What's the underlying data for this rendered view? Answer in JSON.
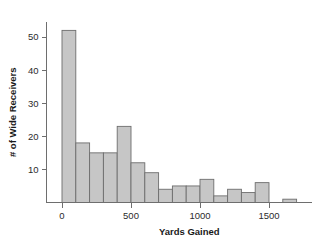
{
  "chart_data": {
    "type": "bar",
    "title": "",
    "xlabel": "Yards Gained",
    "ylabel": "# of Wide Receivers",
    "xlim": [
      -60,
      1760
    ],
    "ylim": [
      0,
      56
    ],
    "grid": false,
    "legend": null,
    "bin_width": 100,
    "bar_fill": "#c6c6c6",
    "bar_stroke": "#6d6d6d",
    "axis_color": "#6e6e6e",
    "xticks": [
      0,
      500,
      1000,
      1500
    ],
    "xtick_labels": [
      "0",
      "500",
      "1000",
      "1500"
    ],
    "yticks": [
      10,
      20,
      30,
      40,
      50
    ],
    "ytick_labels": [
      "10",
      "20",
      "30",
      "40",
      "50"
    ],
    "bins": [
      {
        "x0": 0,
        "x1": 100,
        "count": 52
      },
      {
        "x0": 100,
        "x1": 200,
        "count": 18
      },
      {
        "x0": 200,
        "x1": 300,
        "count": 15
      },
      {
        "x0": 300,
        "x1": 400,
        "count": 15
      },
      {
        "x0": 400,
        "x1": 500,
        "count": 23
      },
      {
        "x0": 500,
        "x1": 600,
        "count": 12
      },
      {
        "x0": 600,
        "x1": 700,
        "count": 9
      },
      {
        "x0": 700,
        "x1": 800,
        "count": 4
      },
      {
        "x0": 800,
        "x1": 900,
        "count": 5
      },
      {
        "x0": 900,
        "x1": 1000,
        "count": 5
      },
      {
        "x0": 1000,
        "x1": 1100,
        "count": 7
      },
      {
        "x0": 1100,
        "x1": 1200,
        "count": 2
      },
      {
        "x0": 1200,
        "x1": 1300,
        "count": 4
      },
      {
        "x0": 1300,
        "x1": 1400,
        "count": 3
      },
      {
        "x0": 1400,
        "x1": 1500,
        "count": 6
      },
      {
        "x0": 1600,
        "x1": 1700,
        "count": 1
      }
    ],
    "categories": [
      "0-100",
      "100-200",
      "200-300",
      "300-400",
      "400-500",
      "500-600",
      "600-700",
      "700-800",
      "800-900",
      "900-1000",
      "1000-1100",
      "1100-1200",
      "1200-1300",
      "1300-1400",
      "1400-1500",
      "1600-1700"
    ],
    "values": [
      52,
      18,
      15,
      15,
      23,
      12,
      9,
      4,
      5,
      5,
      7,
      2,
      4,
      3,
      6,
      1
    ]
  }
}
